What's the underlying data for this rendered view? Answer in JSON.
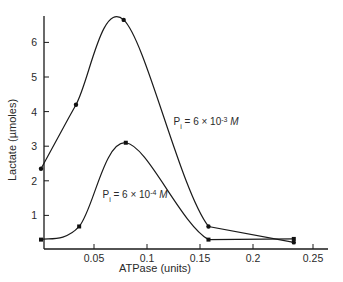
{
  "chart_data": {
    "type": "line",
    "title": "",
    "xlabel": "ATPase (units)",
    "ylabel": "Lactate (µmoles)",
    "xlim": [
      0,
      0.27
    ],
    "ylim": [
      0,
      6.9
    ],
    "grid": false,
    "legend": "inline annotations",
    "x_ticks": [
      {
        "value": 0.05,
        "label": "0.05"
      },
      {
        "value": 0.1,
        "label": "0.1"
      },
      {
        "value": 0.15,
        "label": "0.15"
      },
      {
        "value": 0.2,
        "label": "0.2"
      },
      {
        "value": 0.25,
        "label": "0.25"
      }
    ],
    "y_ticks": [
      {
        "value": 1,
        "label": "1"
      },
      {
        "value": 2,
        "label": "2"
      },
      {
        "value": 3,
        "label": "3"
      },
      {
        "value": 4,
        "label": "4"
      },
      {
        "value": 5,
        "label": "5"
      },
      {
        "value": 6,
        "label": "6"
      }
    ],
    "series": [
      {
        "name": "Pi = 6 x 10^-3 M",
        "marker": "circle",
        "x": [
          0.0,
          0.033,
          0.078,
          0.158,
          0.234
        ],
        "y": [
          2.35,
          4.2,
          6.65,
          0.68,
          0.22
        ]
      },
      {
        "name": "Pi = 6 x 10^-4 M",
        "marker": "square",
        "x": [
          0.0,
          0.036,
          0.08,
          0.158,
          0.234
        ],
        "y": [
          0.3,
          0.68,
          3.1,
          0.3,
          0.32
        ]
      }
    ],
    "annotations": [
      {
        "series": 0,
        "base": "P",
        "sub": "i",
        "text": " = 6 × 10",
        "sup": "-3",
        "unit": "M",
        "x": 0.125,
        "y": 3.6
      },
      {
        "series": 1,
        "base": "P",
        "sub": "i",
        "text": " = 6 × 10",
        "sup": "-4",
        "unit": "M",
        "x": 0.058,
        "y": 1.5
      }
    ]
  }
}
